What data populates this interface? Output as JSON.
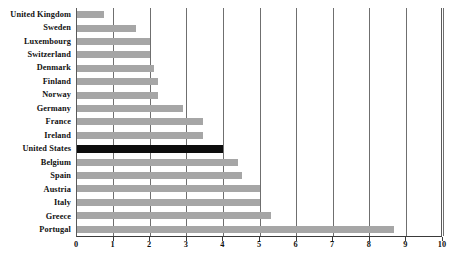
{
  "chart_data": {
    "type": "bar",
    "orientation": "horizontal",
    "title": "",
    "subtitle": "",
    "xlabel": "",
    "ylabel": "",
    "xlim": [
      0,
      10
    ],
    "xticks": [
      "0",
      "1",
      "2",
      "3",
      "4",
      "5",
      "6",
      "7",
      "8",
      "9",
      "10"
    ],
    "grid": true,
    "legend": "none",
    "categories": [
      "United Kingdom",
      "Sweden",
      "Luxembourg",
      "Switzerland",
      "Denmark",
      "Finland",
      "Norway",
      "Germany",
      "France",
      "Ireland",
      "United States",
      "Belgium",
      "Spain",
      "Austria",
      "Italy",
      "Greece",
      "Portugal"
    ],
    "values": [
      0.75,
      1.6,
      2.0,
      2.0,
      2.1,
      2.2,
      2.2,
      2.9,
      3.45,
      3.45,
      4.0,
      4.4,
      4.5,
      5.0,
      5.0,
      5.3,
      8.65
    ],
    "highlight_category": "United States",
    "colors": {
      "bar": "#a6a6a6",
      "highlight_bar": "#0d0d0d",
      "gridline": "#6f6f6f",
      "axis": "#3a3a3a",
      "background": "#ffffff",
      "text": "#111111"
    }
  }
}
